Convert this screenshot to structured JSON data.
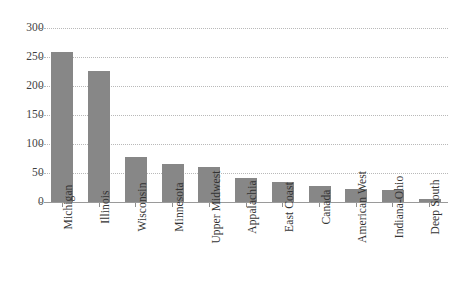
{
  "chart_data": {
    "type": "bar",
    "title": "",
    "xlabel": "",
    "ylabel": "",
    "ylim": [
      0,
      300
    ],
    "yticks": [
      0,
      50,
      100,
      150,
      200,
      250,
      300
    ],
    "grid": true,
    "legend": "none",
    "bar_color": "#878787",
    "categories": [
      "Michigan",
      "Illinois",
      "Wisconsin",
      "Minnesota",
      "Upper Midwest",
      "Appalachia",
      "East Coast",
      "Canada",
      "American West",
      "Indiana-Ohio",
      "Deep South"
    ],
    "values": [
      258,
      226,
      78,
      66,
      61,
      42,
      34,
      28,
      23,
      21,
      5
    ]
  }
}
